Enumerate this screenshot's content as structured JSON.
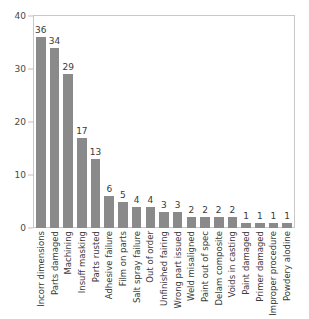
{
  "chart_data": {
    "type": "bar",
    "title": "",
    "subtitle": "",
    "xlabel": "",
    "ylabel": "",
    "ylim": [
      0,
      40
    ],
    "yticks": [
      0,
      10,
      20,
      30,
      40
    ],
    "grid": false,
    "legend": false,
    "bar_color": "#8a8a8a",
    "frame_color": "#c8c8c8",
    "value_labels_shown": true,
    "xtick_rotation": 90,
    "categories": [
      "Incorr dimensions",
      "Parts damaged",
      "Machining",
      "Insuff masking",
      "Parts rusted",
      "Adhesive failure",
      "Film on parts",
      "Salt spray failure",
      "Out of order",
      "Unfinished fairing",
      "Wrong part issued",
      "Weld misaligned",
      "Paint out of spec",
      "Delam composite",
      "Voids in casting",
      "Paint damaged",
      "Primer damaged",
      "Improper procedure",
      "Powdery alodine"
    ],
    "values": [
      36,
      34,
      29,
      17,
      13,
      6,
      5,
      4,
      4,
      3,
      3,
      2,
      2,
      2,
      2,
      1,
      1,
      1,
      1
    ]
  }
}
